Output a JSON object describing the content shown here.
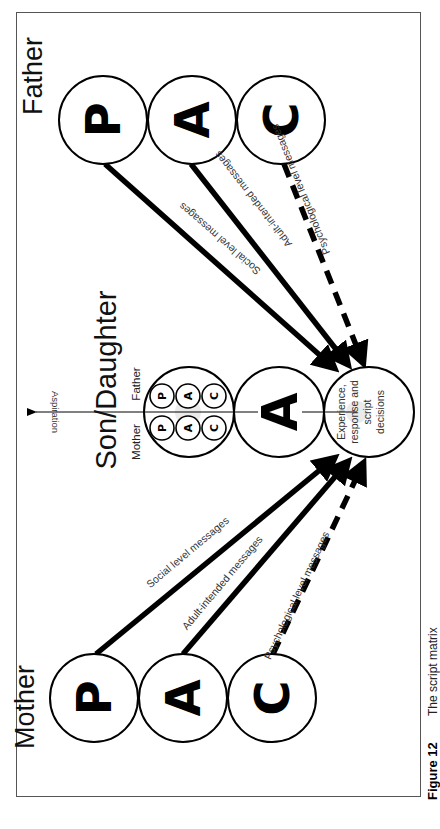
{
  "figure": {
    "caption_number": "Figure 12",
    "caption_title": "The script matrix"
  },
  "father": {
    "label": "Father",
    "states": [
      "P",
      "A",
      "C"
    ]
  },
  "mother": {
    "label": "Mother",
    "states": [
      "P",
      "A",
      "C"
    ]
  },
  "child": {
    "label": "Son/Daughter",
    "parent_side_mother_label": "Mother",
    "parent_side_father_label": "Father",
    "mother_mini_states": [
      "P",
      "A",
      "C"
    ],
    "father_mini_states": [
      "P",
      "A",
      "C"
    ],
    "adult_state": "A",
    "child_state_text": [
      "Experience,",
      "response and",
      "script",
      "decisions"
    ]
  },
  "axis": {
    "label": "Aspiration"
  },
  "messages": {
    "father": {
      "social": "Social level messages",
      "adult": "Adult-intended messages",
      "psychological": "Psychological level messages"
    },
    "mother": {
      "social": "Social level messages",
      "adult": "Adult-intended messages",
      "psychological": "Psychological level messages"
    }
  }
}
